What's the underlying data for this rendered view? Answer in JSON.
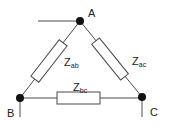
{
  "diagram": {
    "type": "delta-impedance-network",
    "nodes": [
      {
        "id": "A",
        "label": "A"
      },
      {
        "id": "B",
        "label": "B"
      },
      {
        "id": "C",
        "label": "C"
      }
    ],
    "impedances": [
      {
        "id": "ab",
        "symbol": "Z",
        "subscript": "ab",
        "between": [
          "A",
          "B"
        ]
      },
      {
        "id": "ac",
        "symbol": "Z",
        "subscript": "ac",
        "between": [
          "A",
          "C"
        ]
      },
      {
        "id": "bc",
        "symbol": "Z",
        "subscript": "bc",
        "between": [
          "B",
          "C"
        ]
      }
    ],
    "colors": {
      "wire": "#4a4a4a",
      "node": "#111111",
      "background": "#ffffff"
    }
  }
}
